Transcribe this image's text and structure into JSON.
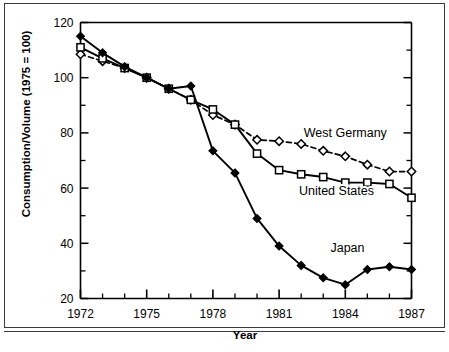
{
  "chart_data": {
    "type": "line",
    "title": "",
    "xlabel": "Year",
    "ylabel": "Consumption/Volume (1975 = 100)",
    "xlim": [
      1972,
      1987
    ],
    "ylim": [
      20,
      120
    ],
    "ytick_step": 20,
    "yticks": [
      20,
      40,
      60,
      80,
      100,
      120
    ],
    "ytick_labels": [
      "20",
      "40",
      "60",
      "80",
      "100",
      "120"
    ],
    "y_minor_step": 10,
    "xticks": [
      1972,
      1973,
      1974,
      1975,
      1976,
      1977,
      1978,
      1979,
      1980,
      1981,
      1982,
      1983,
      1984,
      1985,
      1986,
      1987
    ],
    "xtick_labels_shown": [
      "1972",
      "1975",
      "1978",
      "1981",
      "1984",
      "1987"
    ],
    "xtick_labeled_values": [
      1972,
      1975,
      1978,
      1981,
      1984,
      1987
    ],
    "grid": false,
    "legend_position": "inline-annotations",
    "x": [
      1972,
      1973,
      1974,
      1975,
      1976,
      1977,
      1978,
      1979,
      1980,
      1981,
      1982,
      1983,
      1984,
      1985,
      1986,
      1987
    ],
    "series": [
      {
        "name": "West Germany",
        "marker": "open-diamond",
        "line_style": "dashed",
        "color": "#000000",
        "label_x": 1984.0,
        "label_y": 78.5,
        "values": [
          108.5,
          106.0,
          103.5,
          100.0,
          96.0,
          92.0,
          86.5,
          83.0,
          77.5,
          77.0,
          76.0,
          73.5,
          71.5,
          68.5,
          66.0,
          66.0
        ]
      },
      {
        "name": "United States",
        "marker": "open-square",
        "line_style": "solid",
        "color": "#000000",
        "label_x": 1983.6,
        "label_y": 57.5,
        "values": [
          111.0,
          107.0,
          103.5,
          100.0,
          96.0,
          92.0,
          88.5,
          83.0,
          72.5,
          66.5,
          65.0,
          64.0,
          62.0,
          62.0,
          61.5,
          56.5
        ]
      },
      {
        "name": "Japan",
        "marker": "filled-diamond",
        "line_style": "solid",
        "color": "#000000",
        "label_x": 1984.1,
        "label_y": 37.0,
        "values": [
          115.0,
          109.0,
          104.0,
          100.0,
          96.0,
          97.0,
          73.5,
          65.5,
          49.0,
          39.0,
          32.0,
          27.5,
          25.0,
          30.5,
          31.5,
          30.5
        ]
      }
    ]
  }
}
